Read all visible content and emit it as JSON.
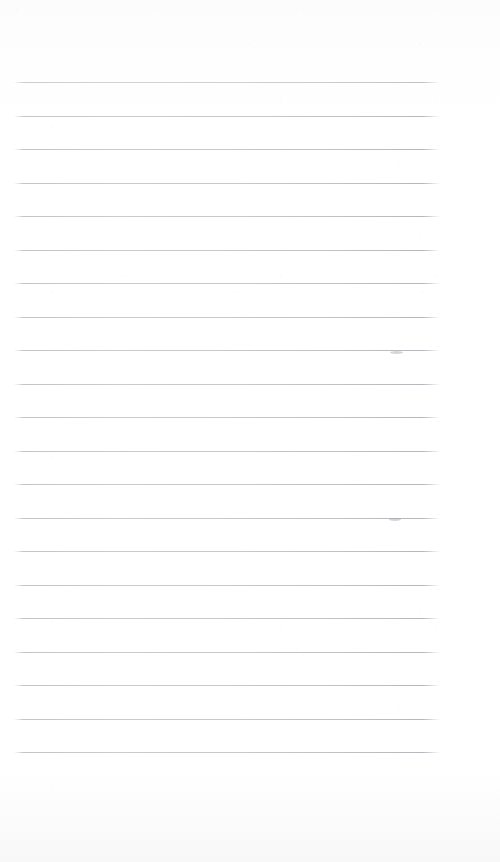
{
  "document": {
    "kind": "scanned-page",
    "title": "Blank Ruled Notebook Page",
    "page_width": 500,
    "page_height": 862,
    "background_color": "#ffffff",
    "text_content": "",
    "has_visible_text": false
  },
  "ruling": {
    "line_count": 21,
    "line_color": "#c2c2c6",
    "line_thickness": 1,
    "line_spacing": 33.5,
    "first_line_y": 82,
    "last_line_y": 752,
    "line_start_x": 14,
    "line_end_x": 440,
    "line_length": 426,
    "top_margin": 82,
    "bottom_margin": 110,
    "left_margin": 14,
    "right_margin": 60,
    "lines_y": [
      82,
      115.5,
      149,
      182.5,
      216,
      249.5,
      283,
      316.5,
      350,
      383.5,
      417,
      450.5,
      484,
      517.5,
      551,
      584.5,
      618,
      651.5,
      685,
      718.5,
      752
    ]
  },
  "marks": {
    "label": "faint pencil smudges",
    "items": [
      {
        "x": 390,
        "y": 351,
        "width": 13,
        "height": 3
      },
      {
        "x": 389,
        "y": 518,
        "width": 12,
        "height": 3
      }
    ]
  }
}
